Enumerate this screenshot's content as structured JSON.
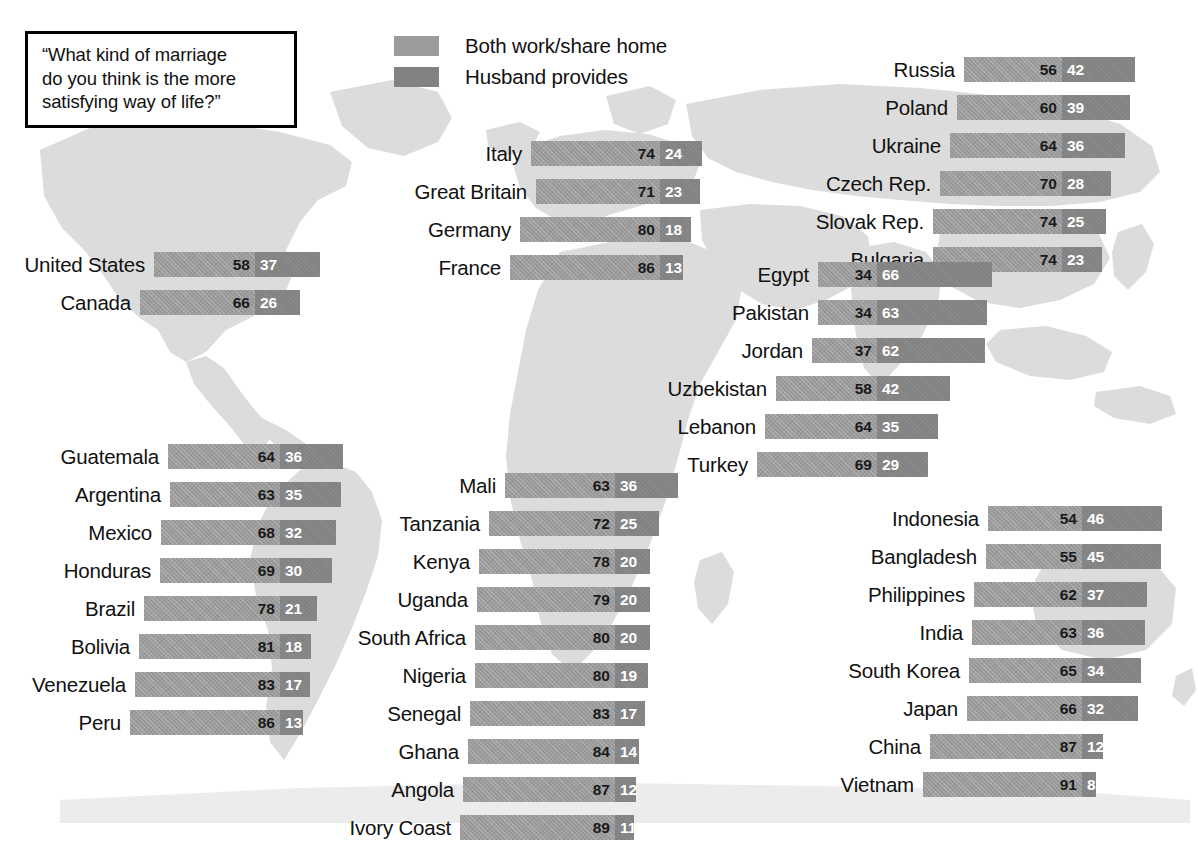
{
  "question": {
    "lines": [
      "“What kind of marriage",
      "do you think is the more",
      "satisfying way of life?”"
    ]
  },
  "legend": {
    "items": [
      {
        "label": "Both work/share home",
        "swatch": "light",
        "color": "#9b9b9b"
      },
      {
        "label": "Husband provides",
        "swatch": "dark",
        "color": "#828282"
      }
    ]
  },
  "colors": {
    "both_work": "#9b9b9b",
    "husband_provides": "#828282",
    "map": "#dcdcdc",
    "text": "#111111"
  },
  "chart_data": {
    "type": "bar",
    "title": "“What kind of marriage do you think is the more satisfying way of life?”",
    "subtype": "diverging-stacked",
    "unit": "percent",
    "xlabel": "",
    "ylabel": "",
    "series": [
      {
        "name": "Both work/share home",
        "color": "#9b9b9b"
      },
      {
        "name": "Husband provides",
        "color": "#828282"
      }
    ],
    "clusters": [
      {
        "id": "north-america",
        "name": "North America",
        "rows": [
          {
            "label": "United States",
            "both_work": 58,
            "husband_provides": 37
          },
          {
            "label": "Canada",
            "both_work": 66,
            "husband_provides": 26
          }
        ]
      },
      {
        "id": "western-europe",
        "name": "Western Europe",
        "rows": [
          {
            "label": "Italy",
            "both_work": 74,
            "husband_provides": 24
          },
          {
            "label": "Great Britain",
            "both_work": 71,
            "husband_provides": 23
          },
          {
            "label": "Germany",
            "both_work": 80,
            "husband_provides": 18
          },
          {
            "label": "France",
            "both_work": 86,
            "husband_provides": 13
          }
        ]
      },
      {
        "id": "eastern-europe",
        "name": "Eastern Europe",
        "rows": [
          {
            "label": "Russia",
            "both_work": 56,
            "husband_provides": 42
          },
          {
            "label": "Poland",
            "both_work": 60,
            "husband_provides": 39
          },
          {
            "label": "Ukraine",
            "both_work": 64,
            "husband_provides": 36
          },
          {
            "label": "Czech Rep.",
            "both_work": 70,
            "husband_provides": 28
          },
          {
            "label": "Slovak Rep.",
            "both_work": 74,
            "husband_provides": 25
          },
          {
            "label": "Bulgaria",
            "both_work": 74,
            "husband_provides": 23
          }
        ]
      },
      {
        "id": "middle-east",
        "name": "Middle East / Conservative Muslim",
        "rows": [
          {
            "label": "Egypt",
            "both_work": 34,
            "husband_provides": 66
          },
          {
            "label": "Pakistan",
            "both_work": 34,
            "husband_provides": 63
          },
          {
            "label": "Jordan",
            "both_work": 37,
            "husband_provides": 62
          },
          {
            "label": "Uzbekistan",
            "both_work": 58,
            "husband_provides": 42
          },
          {
            "label": "Lebanon",
            "both_work": 64,
            "husband_provides": 35
          },
          {
            "label": "Turkey",
            "both_work": 69,
            "husband_provides": 29
          }
        ]
      },
      {
        "id": "latin-america",
        "name": "Latin America",
        "rows": [
          {
            "label": "Guatemala",
            "both_work": 64,
            "husband_provides": 36
          },
          {
            "label": "Argentina",
            "both_work": 63,
            "husband_provides": 35
          },
          {
            "label": "Mexico",
            "both_work": 68,
            "husband_provides": 32
          },
          {
            "label": "Honduras",
            "both_work": 69,
            "husband_provides": 30
          },
          {
            "label": "Brazil",
            "both_work": 78,
            "husband_provides": 21
          },
          {
            "label": "Bolivia",
            "both_work": 81,
            "husband_provides": 18
          },
          {
            "label": "Venezuela",
            "both_work": 83,
            "husband_provides": 17
          },
          {
            "label": "Peru",
            "both_work": 86,
            "husband_provides": 13
          }
        ]
      },
      {
        "id": "africa",
        "name": "Africa",
        "rows": [
          {
            "label": "Mali",
            "both_work": 63,
            "husband_provides": 36
          },
          {
            "label": "Tanzania",
            "both_work": 72,
            "husband_provides": 25
          },
          {
            "label": "Kenya",
            "both_work": 78,
            "husband_provides": 20
          },
          {
            "label": "Uganda",
            "both_work": 79,
            "husband_provides": 20
          },
          {
            "label": "South Africa",
            "both_work": 80,
            "husband_provides": 20
          },
          {
            "label": "Nigeria",
            "both_work": 80,
            "husband_provides": 19
          },
          {
            "label": "Senegal",
            "both_work": 83,
            "husband_provides": 17
          },
          {
            "label": "Ghana",
            "both_work": 84,
            "husband_provides": 14
          },
          {
            "label": "Angola",
            "both_work": 87,
            "husband_provides": 12
          },
          {
            "label": "Ivory Coast",
            "both_work": 89,
            "husband_provides": 11
          }
        ]
      },
      {
        "id": "asia",
        "name": "Asia",
        "rows": [
          {
            "label": "Indonesia",
            "both_work": 54,
            "husband_provides": 46
          },
          {
            "label": "Bangladesh",
            "both_work": 55,
            "husband_provides": 45
          },
          {
            "label": "Philippines",
            "both_work": 62,
            "husband_provides": 37
          },
          {
            "label": "India",
            "both_work": 63,
            "husband_provides": 36
          },
          {
            "label": "South Korea",
            "both_work": 65,
            "husband_provides": 34
          },
          {
            "label": "Japan",
            "both_work": 66,
            "husband_provides": 32
          },
          {
            "label": "China",
            "both_work": 87,
            "husband_provides": 12
          },
          {
            "label": "Vietnam",
            "both_work": 91,
            "husband_provides": 8
          }
        ]
      }
    ]
  },
  "layout": {
    "px_per_unit": 1.745,
    "bar_height": 25,
    "row_height": 38,
    "label_gap": 9,
    "clusters": {
      "north-america": {
        "split_x": 255,
        "top": 252,
        "label_width": 160
      },
      "western-europe": {
        "split_x": 660,
        "top": 141,
        "label_width": 160
      },
      "eastern-europe": {
        "split_x": 1062,
        "top": 57,
        "label_width": 160
      },
      "middle-east": {
        "split_x": 877,
        "top": 262,
        "label_width": 175
      },
      "latin-america": {
        "split_x": 280,
        "top": 444,
        "label_width": 160
      },
      "africa": {
        "split_x": 615,
        "top": 473,
        "label_width": 175
      },
      "asia": {
        "split_x": 1082,
        "top": 506,
        "label_width": 175
      }
    }
  }
}
